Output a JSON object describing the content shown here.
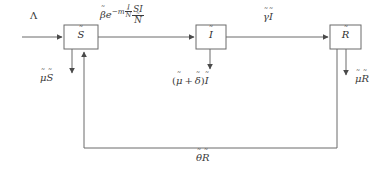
{
  "diagram": {
    "background_color": "#ffffff",
    "line_color": "#6b6b6b",
    "text_color": "#3a3a3a",
    "compartments": [
      {
        "id": "S",
        "label": "S̃",
        "x": 64,
        "y": 25,
        "w": 34,
        "h": 24
      },
      {
        "id": "I",
        "label": "Ĩ",
        "x": 196,
        "y": 25,
        "w": 30,
        "h": 24
      },
      {
        "id": "R",
        "label": "R̃",
        "x": 330,
        "y": 25,
        "w": 31,
        "h": 24
      }
    ],
    "labels": {
      "recruitment": "Λ",
      "transmission_plain": "β̃ e^(-m Ĩ/Ñ) S̃Ĩ/Ñ",
      "transmission_parts": {
        "beta": "β",
        "exp_base": "e",
        "exp_minus_m": "−m",
        "exp_frac_num": "I",
        "exp_frac_den": "N",
        "frac_num": "SI",
        "frac_den": "N"
      },
      "recovery": "γ̃Ĩ",
      "natural_death_S": "μ̃S̃",
      "removal_I_parts": {
        "open": "(",
        "mu": "μ",
        "plus": "+",
        "delta": "δ",
        "close": ")",
        "I": "I"
      },
      "removal_I_plain": "(μ̃ + δ̃)Ĩ",
      "natural_death_R": "μ̃R̃",
      "loss_of_immunity": "θ̃R̃",
      "tilde": "˜",
      "mu": "μ",
      "gamma": "γ",
      "theta": "θ",
      "S": "S",
      "I": "I",
      "R": "R"
    }
  }
}
